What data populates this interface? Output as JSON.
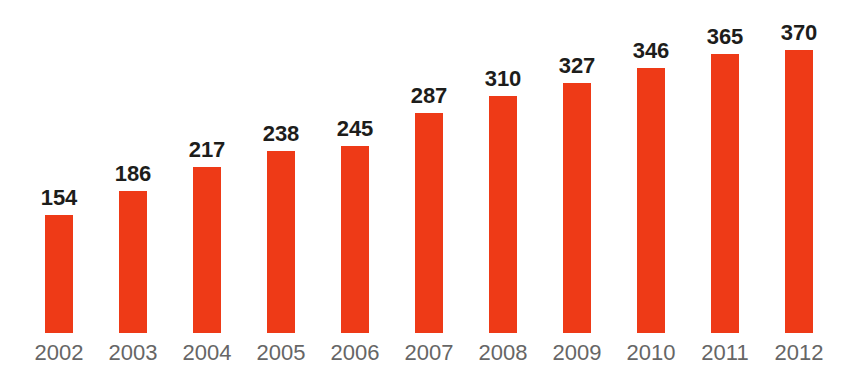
{
  "chart_data": {
    "type": "bar",
    "categories": [
      "2002",
      "2003",
      "2004",
      "2005",
      "2006",
      "2007",
      "2008",
      "2009",
      "2010",
      "2011",
      "2012"
    ],
    "values": [
      154,
      186,
      217,
      238,
      245,
      287,
      310,
      327,
      346,
      365,
      370
    ],
    "title": "",
    "xlabel": "",
    "ylabel": "",
    "ylim": [
      0,
      370
    ],
    "grid": false,
    "legend": false,
    "value_labels_shown": true,
    "bar_color": "#ee3a17",
    "value_label_color": "#1d1d1b",
    "year_label_color": "#666666",
    "background_color": "#ffffff"
  }
}
